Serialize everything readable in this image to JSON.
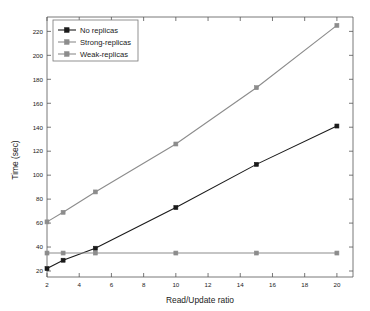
{
  "chart_data": {
    "type": "line",
    "title": "",
    "xlabel": "Read/Update ratio",
    "ylabel": "Time (sec)",
    "xlim": [
      2,
      21
    ],
    "ylim": [
      15,
      232
    ],
    "xticks": [
      2,
      4,
      6,
      8,
      10,
      12,
      14,
      16,
      18,
      20
    ],
    "yticks": [
      20,
      40,
      60,
      80,
      100,
      120,
      140,
      160,
      180,
      200,
      220
    ],
    "grid": false,
    "legend_position": "top-left",
    "x": [
      2,
      3,
      5,
      10,
      15,
      20
    ],
    "series": [
      {
        "name": "No replicas",
        "values": [
          22,
          29,
          39,
          73,
          109,
          141
        ],
        "color": "#1a1a1a",
        "marker": "square"
      },
      {
        "name": "Strong-replicas",
        "values": [
          61,
          69,
          86,
          126,
          173,
          225
        ],
        "color": "#8c8c8c",
        "marker": "square"
      },
      {
        "name": "Weak-replicas",
        "values": [
          35,
          35,
          35,
          35,
          35,
          35
        ],
        "color": "#8c8c8c",
        "marker": "square"
      }
    ]
  },
  "axes": {
    "y_title": "Time (sec)",
    "x_title": "Read/Update ratio",
    "x_tick_labels": [
      "2",
      "4",
      "6",
      "8",
      "10",
      "12",
      "14",
      "16",
      "18",
      "20"
    ],
    "y_tick_labels": [
      "20",
      "40",
      "60",
      "80",
      "100",
      "120",
      "140",
      "160",
      "180",
      "200",
      "220"
    ]
  },
  "legend": {
    "entries": [
      {
        "label": "No replicas"
      },
      {
        "label": "Strong-replicas"
      },
      {
        "label": "Weak-replicas"
      }
    ]
  }
}
